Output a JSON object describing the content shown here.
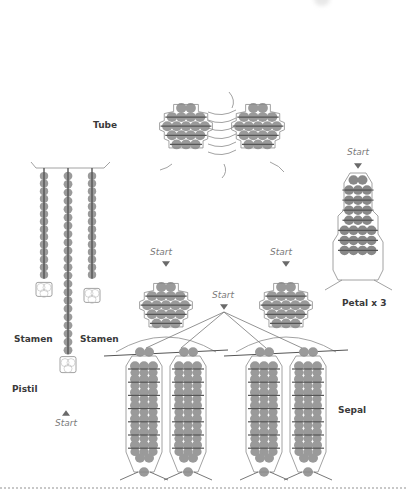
{
  "labels": {
    "tube": "Tube",
    "stamen_left": "Stamen",
    "stamen_right": "Stamen",
    "pistil": "Pistil",
    "petal": "Petal x 3",
    "sepal": "Sepal"
  },
  "start_markers": {
    "petal": "Start",
    "sepal_left": "Start",
    "sepal_middle": "Start",
    "sepal_right": "Start",
    "pistil": "Start"
  },
  "colors": {
    "bead": "#9a9a9a",
    "bead_dark": "#6e6e6e",
    "thread": "#555555",
    "outline": "#8a8a8a",
    "label": "#3a3a3a",
    "start_text": "#7a7a7a",
    "divider": "#c8c8c8"
  },
  "components": {
    "tube": {
      "panels": 2,
      "rows": [
        2,
        4,
        5,
        4,
        3
      ]
    },
    "petal": {
      "rows": [
        2,
        3,
        3,
        3,
        3,
        4,
        4,
        4
      ]
    },
    "stamen": {
      "strands": 2,
      "beads": 14
    },
    "pistil": {
      "beads": 22
    },
    "sepal": {
      "units": 2,
      "top_rows": [
        2,
        4,
        5,
        4,
        3
      ],
      "column_rows": 7
    }
  }
}
